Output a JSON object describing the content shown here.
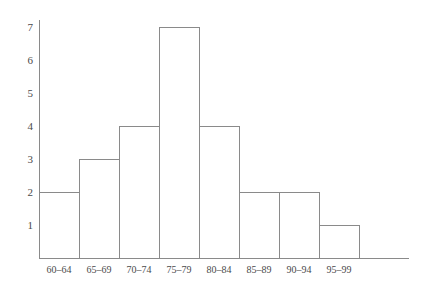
{
  "chart_data": {
    "type": "bar",
    "title": "",
    "subtitle": "",
    "xlabel": "",
    "ylabel": "",
    "categories": [
      "60–64",
      "65–69",
      "70–74",
      "75–79",
      "80–84",
      "85–89",
      "90–94",
      "95–99"
    ],
    "values": [
      2,
      3,
      4,
      7,
      4,
      2,
      2,
      1
    ],
    "ylim": [
      0,
      7
    ],
    "yticks": [
      1,
      2,
      3,
      4,
      5,
      6,
      7
    ],
    "ytick_labels": [
      "1",
      "2",
      "3",
      "4",
      "5",
      "6",
      "7"
    ],
    "grid": false,
    "legend": null,
    "annotations": [],
    "style": {
      "bar_fill": "#ffffff",
      "bar_stroke": "#8a8a8a",
      "axis_color": "#8a8a8a",
      "text_color": "#4a4a4a",
      "background": "#ffffff"
    }
  }
}
